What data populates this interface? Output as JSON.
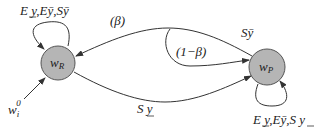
{
  "nodes": {
    "wR": {
      "label": "w",
      "sub": "R"
    },
    "wP": {
      "label": "w",
      "sub": "P"
    }
  },
  "edges": {
    "wR_self_loop": {
      "label_parts": [
        "E y",
        ",",
        "Eȳ",
        ",",
        "Sȳ"
      ],
      "underline_first": true
    },
    "wP_self_loop": {
      "label_parts": [
        "E y",
        ",",
        "Eȳ",
        ",",
        "S y"
      ],
      "underline_first": true,
      "underline_last": true
    },
    "wP_to_wR": {
      "label": "(β)"
    },
    "branch_to_wP": {
      "label": "(1−β)"
    },
    "wP_out_top": {
      "label": "Sȳ"
    },
    "wR_to_wP": {
      "label": "S y",
      "underline": true
    },
    "input": {
      "label": "w",
      "sub": "i",
      "sup": "0"
    }
  },
  "colors": {
    "node_fill": "#b5b5b5",
    "node_stroke": "#555555",
    "edge": "#333333"
  }
}
